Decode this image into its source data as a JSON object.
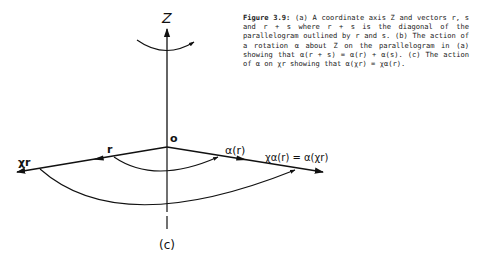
{
  "caption": {
    "figure_number": "Figure 3.9:",
    "text": "(a) A coordinate axis Z and vectors r, s and r + s where r + s is the diagonal of the parallelogram outlined by r and s.  (b) The action of a rotation α about Z on the parallelogram in (a) showing that α(r + s) = α(r) + α(s).  (c) The action of α on χr showing that α(χr) = χα(r)."
  },
  "diagram": {
    "axis_label": "Z",
    "origin_label": "o",
    "vector_r_label": "r",
    "vector_xr_label": "χr",
    "vector_alpha_r_label": "α(r)",
    "vector_x_alpha_r_label": "χα(r) = α(χr)",
    "panel_label": "(c)"
  },
  "colors": {
    "ink": "#111111",
    "background": "#ffffff"
  }
}
